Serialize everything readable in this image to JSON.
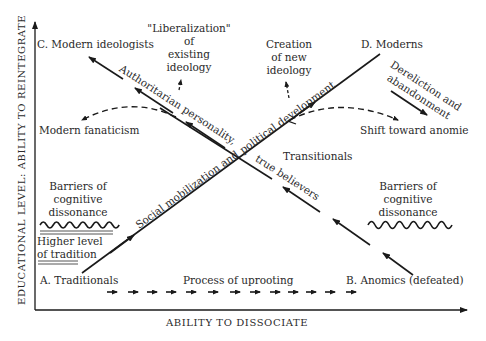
{
  "axes": {
    "y_label": "EDUCATIONAL LEVEL: ABILITY TO REINTEGRATE",
    "x_label": "ABILITY TO DISSOCIATE"
  },
  "corners": {
    "a": "A.  Traditionals",
    "b": "B.  Anomics (defeated)",
    "c": "C.  Modern ideologists",
    "d": "D.  Moderns"
  },
  "paths": {
    "main_lower": "Social mobilization and",
    "main_upper": "political development",
    "reverse_upper": "Authoritarian personality,",
    "reverse_lower": "true believers",
    "uprooting": "Process of uprooting"
  },
  "notes": {
    "liberalization": [
      "\"Liberalization\"",
      "of",
      "existing",
      "ideology"
    ],
    "creation": [
      "Creation",
      "of new",
      "ideology"
    ],
    "dereliction": [
      "Dereliction and",
      "abandonment"
    ],
    "modern_fanaticism": "Modern fanaticism",
    "shift_anomie": "Shift toward anomie",
    "transitionals": "Transitionals",
    "barriers_left": [
      "Barriers of",
      "cognitive",
      "dissonance"
    ],
    "barriers_right": [
      "Barriers of",
      "cognitive",
      "dissonance"
    ],
    "higher_tradition": [
      "Higher level",
      "of tradition"
    ]
  },
  "colors": {
    "ink": "#1a1a1a",
    "text": "#2a2a2a",
    "background": "#ffffff"
  }
}
